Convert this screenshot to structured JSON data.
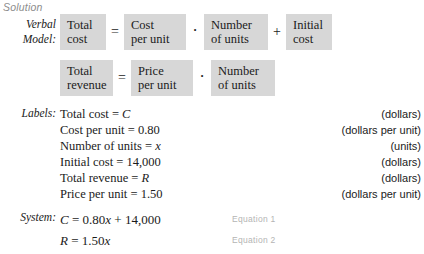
{
  "colors": {
    "box_fill": "#d7d7d7",
    "heading_gray": "#8c8c8c",
    "equation_tag_gray": "#b4b4b4",
    "text": "#1b1b1b",
    "page_background": "#ffffff"
  },
  "heading": {
    "solution": "Solution"
  },
  "gutter": {
    "verbal_model_line1": "Verbal",
    "verbal_model_line2": "Model:",
    "labels": "Labels:",
    "system": "System:"
  },
  "verbal_model": {
    "row1": {
      "boxes": [
        {
          "line1": "Total",
          "line2": "cost"
        },
        {
          "line1": "Cost",
          "line2": "per unit"
        },
        {
          "line1": "Number",
          "line2": "of units"
        },
        {
          "line1": "Initial",
          "line2": "cost"
        }
      ],
      "operators": [
        "=",
        "·",
        "+"
      ]
    },
    "row2": {
      "boxes": [
        {
          "line1": "Total",
          "line2": "revenue"
        },
        {
          "line1": "Price",
          "line2": "per unit"
        },
        {
          "line1": "Number",
          "line2": "of units"
        }
      ],
      "operators": [
        "=",
        "·"
      ]
    }
  },
  "labels": [
    {
      "text_plain": "Total cost = ",
      "text_var": "C",
      "text_tail": "",
      "unit": "(dollars)"
    },
    {
      "text_plain": "Cost per unit = ",
      "text_var": "",
      "text_tail": "0.80",
      "unit": "(dollars per unit)"
    },
    {
      "text_plain": "Number of units = ",
      "text_var": "x",
      "text_tail": "",
      "unit": "(units)"
    },
    {
      "text_plain": "Initial cost = ",
      "text_var": "",
      "text_tail": "14,000",
      "unit": "(dollars)"
    },
    {
      "text_plain": "Total revenue = ",
      "text_var": "R",
      "text_tail": "",
      "unit": "(dollars)"
    },
    {
      "text_plain": "Price per unit = ",
      "text_var": "",
      "text_tail": "1.50",
      "unit": "(dollars per unit)"
    }
  ],
  "system": [
    {
      "lhs": "C",
      "mid": " = 0.80",
      "var2": "x",
      "tail": " + 14,000",
      "tag": "Equation 1"
    },
    {
      "lhs": "R",
      "mid": " = 1.50",
      "var2": "x",
      "tail": "",
      "tag": "Equation 2"
    }
  ]
}
